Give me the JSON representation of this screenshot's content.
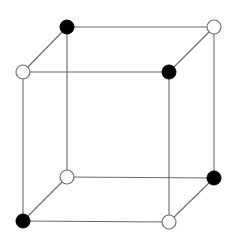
{
  "diagram": {
    "type": "cube-lattice",
    "width": 234,
    "height": 238,
    "vertex_radius": 7,
    "colors": {
      "edge": "#6a6a6a",
      "black_vertex": "#000000",
      "white_vertex_fill": "#ffffff",
      "white_vertex_stroke": "#707070"
    },
    "vertices": [
      {
        "id": "back-top-left",
        "x": 67,
        "y": 27,
        "fill": "black"
      },
      {
        "id": "back-top-right",
        "x": 214,
        "y": 27,
        "fill": "white"
      },
      {
        "id": "front-top-left",
        "x": 23,
        "y": 72,
        "fill": "white"
      },
      {
        "id": "front-top-right",
        "x": 169,
        "y": 72,
        "fill": "black"
      },
      {
        "id": "back-bottom-left",
        "x": 67,
        "y": 177,
        "fill": "white"
      },
      {
        "id": "back-bottom-right",
        "x": 214,
        "y": 178,
        "fill": "black"
      },
      {
        "id": "front-bottom-left",
        "x": 23,
        "y": 221,
        "fill": "black"
      },
      {
        "id": "front-bottom-right",
        "x": 169,
        "y": 222,
        "fill": "white"
      }
    ],
    "edges": [
      [
        "back-top-left",
        "back-top-right"
      ],
      [
        "back-top-left",
        "front-top-left"
      ],
      [
        "back-top-right",
        "front-top-right"
      ],
      [
        "front-top-left",
        "front-top-right"
      ],
      [
        "back-bottom-left",
        "back-bottom-right"
      ],
      [
        "back-bottom-left",
        "front-bottom-left"
      ],
      [
        "back-bottom-right",
        "front-bottom-right"
      ],
      [
        "front-bottom-left",
        "front-bottom-right"
      ],
      [
        "back-top-left",
        "back-bottom-left"
      ],
      [
        "back-top-right",
        "back-bottom-right"
      ],
      [
        "front-top-left",
        "front-bottom-left"
      ],
      [
        "front-top-right",
        "front-bottom-right"
      ]
    ]
  }
}
